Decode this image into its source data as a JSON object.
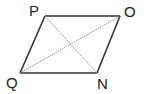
{
  "figure": {
    "type": "parallelogram",
    "vertices": [
      {
        "name": "P",
        "x": 45,
        "y": 16
      },
      {
        "name": "O",
        "x": 120,
        "y": 16
      },
      {
        "name": "N",
        "x": 97,
        "y": 73
      },
      {
        "name": "Q",
        "x": 20,
        "y": 73
      }
    ],
    "labels": {
      "P": "P",
      "O": "O",
      "Q": "Q",
      "N": "N"
    },
    "sides": [
      "PO",
      "ON",
      "NQ",
      "QP"
    ],
    "diagonals": [
      "PN",
      "QO"
    ],
    "colors": {
      "side": "#333333",
      "diagonal": "#888888",
      "label": "#222222"
    }
  }
}
